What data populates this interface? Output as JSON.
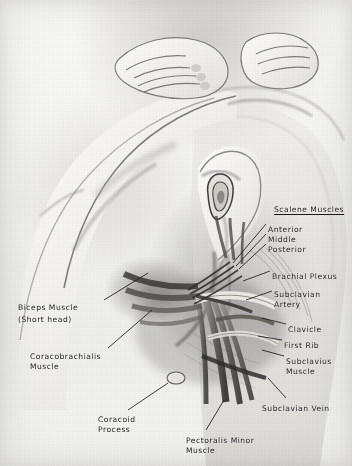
{
  "figure": {
    "kind": "anatomical-illustration",
    "background_color": "#f2f2f0",
    "ink_color": "#1c1c1c",
    "width": 352,
    "height": 466
  },
  "labels": [
    {
      "id": "scalene-muscles",
      "text": "Scalene Muscles",
      "heading": true,
      "x": 274,
      "y": 205,
      "align": "left"
    },
    {
      "id": "anterior",
      "text": "Anterior",
      "heading": false,
      "x": 268,
      "y": 225,
      "align": "left"
    },
    {
      "id": "middle",
      "text": "Middle",
      "heading": false,
      "x": 268,
      "y": 235,
      "align": "left"
    },
    {
      "id": "posterior",
      "text": "Posterior",
      "heading": false,
      "x": 268,
      "y": 245,
      "align": "left"
    },
    {
      "id": "brachial-plexus",
      "text": "Brachial Plexus",
      "heading": false,
      "x": 272,
      "y": 272,
      "align": "left"
    },
    {
      "id": "subclavian-artery",
      "text": "Subclavian\nArtery",
      "heading": false,
      "x": 274,
      "y": 290,
      "align": "left"
    },
    {
      "id": "clavicle",
      "text": "Clavicle",
      "heading": false,
      "x": 288,
      "y": 325,
      "align": "left"
    },
    {
      "id": "first-rib",
      "text": "First Rib",
      "heading": false,
      "x": 284,
      "y": 341,
      "align": "left"
    },
    {
      "id": "subclavius-muscle",
      "text": "Subclavius\nMuscle",
      "heading": false,
      "x": 286,
      "y": 357,
      "align": "left"
    },
    {
      "id": "subclavian-vein",
      "text": "Subclavian Vein",
      "heading": false,
      "x": 262,
      "y": 404,
      "align": "left"
    },
    {
      "id": "biceps-muscle",
      "text": "Biceps Muscle",
      "heading": false,
      "x": 18,
      "y": 303,
      "align": "left"
    },
    {
      "id": "biceps-short-head",
      "text": "(Short head)",
      "heading": false,
      "x": 18,
      "y": 315,
      "align": "left"
    },
    {
      "id": "coracobrachialis",
      "text": "Coracobrachialis\nMuscle",
      "heading": false,
      "x": 30,
      "y": 352,
      "align": "left"
    },
    {
      "id": "coracoid-process",
      "text": "Coracoid\nProcess",
      "heading": false,
      "x": 98,
      "y": 415,
      "align": "left"
    },
    {
      "id": "pectoralis-minor",
      "text": "Pectoralis Minor\nMuscle",
      "heading": false,
      "x": 186,
      "y": 436,
      "align": "left"
    }
  ],
  "leader_lines": [
    {
      "id": "leader-anterior",
      "from": [
        266,
        224
      ],
      "to": [
        233,
        263
      ]
    },
    {
      "id": "leader-middle",
      "from": [
        266,
        234
      ],
      "to": [
        236,
        266
      ]
    },
    {
      "id": "leader-posterior",
      "from": [
        266,
        244
      ],
      "to": [
        239,
        269
      ]
    },
    {
      "id": "leader-brachial-plexus",
      "from": [
        270,
        271
      ],
      "to": [
        243,
        281
      ]
    },
    {
      "id": "leader-subclavian-artery",
      "from": [
        272,
        291
      ],
      "to": [
        246,
        300
      ]
    },
    {
      "id": "leader-clavicle",
      "from": [
        286,
        324
      ],
      "to": [
        262,
        318
      ]
    },
    {
      "id": "leader-first-rib",
      "from": [
        282,
        340
      ],
      "to": [
        258,
        336
      ]
    },
    {
      "id": "leader-subclavius",
      "from": [
        284,
        356
      ],
      "to": [
        262,
        350
      ]
    },
    {
      "id": "leader-subclavian-vein",
      "from": [
        286,
        398
      ],
      "to": [
        268,
        378
      ]
    },
    {
      "id": "leader-biceps",
      "from": [
        104,
        300
      ],
      "to": [
        148,
        273
      ]
    },
    {
      "id": "leader-coracobrachialis",
      "from": [
        108,
        348
      ],
      "to": [
        152,
        310
      ]
    },
    {
      "id": "leader-coracoid",
      "from": [
        128,
        410
      ],
      "to": [
        168,
        383
      ]
    },
    {
      "id": "leader-pectoralis-minor",
      "from": [
        206,
        430
      ],
      "to": [
        224,
        400
      ]
    }
  ]
}
